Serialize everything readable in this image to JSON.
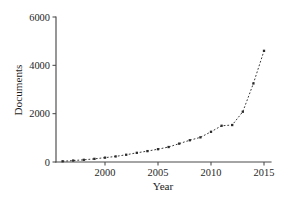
{
  "chart_data": {
    "type": "line",
    "title": "",
    "subtitle": "",
    "xlabel": "Year",
    "ylabel": "Documents",
    "xlim": [
      1995.5,
      2015.5
    ],
    "ylim": [
      0,
      6000
    ],
    "grid": false,
    "legend": false,
    "legend_position": "none",
    "line_style": "dashed",
    "marker": "square",
    "color": "#2b2b2b",
    "x_ticks": [
      2000,
      2005,
      2010,
      2015
    ],
    "x_tick_labels": [
      "2000",
      "2005",
      "2010",
      "2015"
    ],
    "y_ticks": [
      0,
      2000,
      4000,
      6000
    ],
    "y_tick_labels": [
      "0",
      "2000",
      "4000",
      "6000"
    ],
    "x": [
      1996,
      1997,
      1998,
      1999,
      2000,
      2001,
      2002,
      2003,
      2004,
      2005,
      2006,
      2007,
      2008,
      2009,
      2010,
      2011,
      2012,
      2013,
      2014,
      2015
    ],
    "values": [
      30,
      60,
      90,
      130,
      180,
      230,
      300,
      380,
      450,
      530,
      620,
      760,
      900,
      1020,
      1250,
      1500,
      1530,
      2080,
      3250,
      4600
    ],
    "series": [
      {
        "name": "Documents",
        "values": [
          30,
          60,
          90,
          130,
          180,
          230,
          300,
          380,
          450,
          530,
          620,
          760,
          900,
          1020,
          1250,
          1500,
          1530,
          2080,
          3250,
          4600
        ]
      }
    ],
    "annotations": []
  },
  "figure": {
    "background_color": "#ffffff",
    "axis_color": "#4a4a4a",
    "text_color": "#1c1c1c"
  }
}
